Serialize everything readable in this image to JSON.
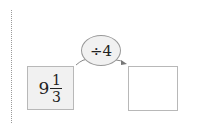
{
  "problem": {
    "start_value": {
      "whole": "9",
      "numerator": "1",
      "denominator": "3"
    },
    "operation": "÷4",
    "result_value": ""
  },
  "colors": {
    "box_fill": "#f1f1f1",
    "border": "#b8b8b8",
    "text": "#222222"
  }
}
